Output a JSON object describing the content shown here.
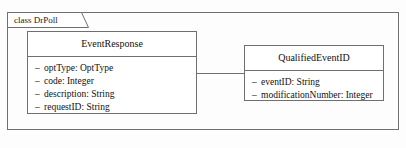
{
  "diagram": {
    "type": "uml-class-diagram",
    "package": {
      "label": "class DrPoll"
    },
    "classes": [
      {
        "id": "event-response",
        "name": "EventResponse",
        "attributes": [
          {
            "visibility": "–",
            "text": "optType: OptType"
          },
          {
            "visibility": "–",
            "text": "code: Integer"
          },
          {
            "visibility": "–",
            "text": "description: String"
          },
          {
            "visibility": "–",
            "text": "requestID: String"
          }
        ]
      },
      {
        "id": "qualified-event-id",
        "name": "QualifiedEventID",
        "attributes": [
          {
            "visibility": "–",
            "text": "eventID: String"
          },
          {
            "visibility": "–",
            "text": "modificationNumber: Integer"
          }
        ]
      }
    ],
    "relationships": [
      {
        "kind": "association",
        "from": "EventResponse",
        "to": "QualifiedEventID",
        "label": ""
      }
    ],
    "colors": {
      "border": "#6f6f6f",
      "text": "#111111",
      "background": "#fdfdfd",
      "class_fill": "#ffffff"
    }
  }
}
